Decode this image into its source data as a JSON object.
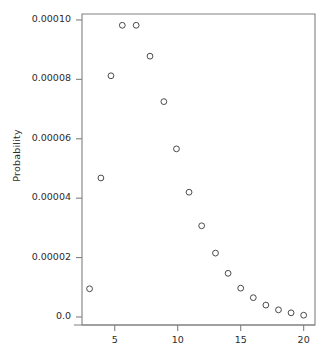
{
  "chart_data": {
    "type": "scatter",
    "title": "",
    "xlabel": "",
    "ylabel": "Probability",
    "xlim": [
      2.4,
      20.9
    ],
    "ylim": [
      -2.7e-06,
      0.000102
    ],
    "grid": false,
    "legend": null,
    "marker": "open-circle",
    "marker_color": "#4a4a4a",
    "xticks": [
      5,
      10,
      15,
      20
    ],
    "xtick_labels": [
      "5",
      "10",
      "15",
      "20"
    ],
    "yticks": [
      0.0,
      2e-05,
      4e-05,
      6e-05,
      8e-05,
      0.0001
    ],
    "ytick_labels": [
      "0.0",
      "0.00002",
      "0.00004",
      "0.00006",
      "0.00008",
      "0.00010"
    ],
    "x": [
      3.0,
      3.9,
      4.7,
      5.6,
      6.7,
      7.8,
      8.9,
      9.9,
      10.9,
      11.9,
      13.0,
      14.0,
      15.0,
      16.0,
      17.0,
      18.0,
      19.0,
      20.0
    ],
    "y": [
      9.5e-06,
      4.68e-05,
      8.12e-05,
      9.82e-05,
      9.82e-05,
      8.78e-05,
      7.25e-05,
      5.66e-05,
      4.2e-05,
      3.07e-05,
      2.15e-05,
      1.47e-05,
      9.7e-06,
      6.5e-06,
      4e-06,
      2.4e-06,
      1.4e-06,
      6e-07
    ],
    "values": [
      9.5e-06,
      4.68e-05,
      8.12e-05,
      9.82e-05,
      9.82e-05,
      8.78e-05,
      7.25e-05,
      5.66e-05,
      4.2e-05,
      3.07e-05,
      2.15e-05,
      1.47e-05,
      9.7e-06,
      6.5e-06,
      4e-06,
      2.4e-06,
      1.4e-06,
      6e-07
    ],
    "categories": [
      "3.0",
      "3.9",
      "4.7",
      "5.6",
      "6.7",
      "7.8",
      "8.9",
      "9.9",
      "10.9",
      "11.9",
      "13.0",
      "14.0",
      "15.0",
      "16.0",
      "17.0",
      "18.0",
      "19.0",
      "20.0"
    ]
  },
  "plot_geometry": {
    "left": 82,
    "right": 315,
    "top": 14,
    "bottom": 325,
    "frame_color": "#808080",
    "tick_color": "#808080",
    "background": "#ffffff"
  }
}
